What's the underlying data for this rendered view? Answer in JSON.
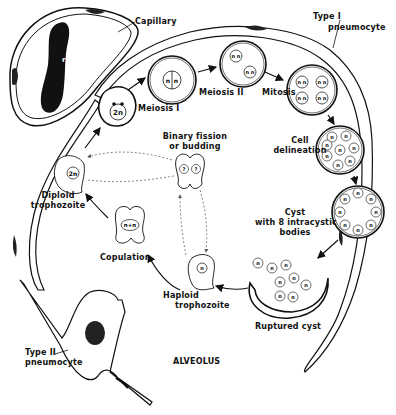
{
  "diagram": {
    "colors": {
      "ink": "#111111",
      "background": "#ffffff",
      "dashed": "#777777"
    },
    "labels": {
      "capillary": "Capillary",
      "rbc": "rbc",
      "type1_line1": "Type I",
      "type1_line2": "pneumocyte",
      "meiosis1": "Meiosis I",
      "meiosis2": "Meiosis II",
      "mitosis": "Mitosis",
      "cell_delineation_line1": "Cell",
      "cell_delineation_line2": "delineation",
      "cyst_line1": "Cyst",
      "cyst_line2": "with 8 intracystic",
      "cyst_line3": "bodies",
      "ruptured_cyst": "Ruptured cyst",
      "haploid_line1": "Haploid",
      "haploid_line2": "trophozoite",
      "copulation": "Copulation",
      "diploid_line1": "Diploid",
      "diploid_line2": "trophozoite",
      "binary_line1": "Binary fission",
      "binary_line2": "or budding",
      "type2_line1": "Type II",
      "type2_line2": "pneumocyte",
      "alveolus": "ALVEOLUS"
    },
    "nucleus_marks": {
      "diploid": "2n",
      "haploid": "n",
      "fused": "n+n",
      "unknown": "?"
    },
    "stages": [
      "Diploid trophozoite",
      "Meiosis I",
      "Meiosis II",
      "Mitosis",
      "Cell delineation",
      "Cyst with 8 intracystic bodies",
      "Ruptured cyst",
      "Haploid trophozoite",
      "Copulation",
      "Diploid trophozoite"
    ]
  }
}
